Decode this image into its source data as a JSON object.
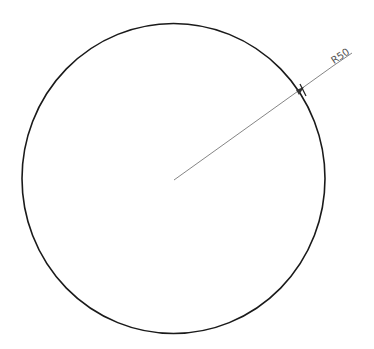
{
  "drawing": {
    "circle": {
      "cx": 173.5,
      "cy": 178.5,
      "rx": 151.5,
      "ry": 155,
      "stroke": "#1a1a1a"
    },
    "dimension": {
      "label": "R50",
      "leader_start": [
        174,
        180
      ],
      "leader_end": [
        333,
        66
      ],
      "underline_end": [
        352,
        54
      ],
      "stroke": "#666666"
    }
  }
}
